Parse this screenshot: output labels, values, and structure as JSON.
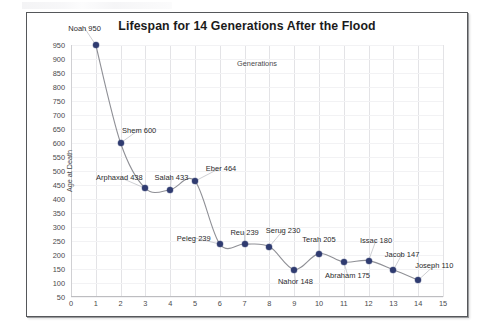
{
  "chart_data": {
    "type": "scatter",
    "title": "Lifespan for 14 Generations After the Flood",
    "xlabel": "Generations",
    "ylabel": "Age at Death",
    "xlim": [
      0,
      15
    ],
    "ylim": [
      50,
      950
    ],
    "grid": true,
    "legend": "none",
    "xticks": [
      "0",
      "1",
      "2",
      "3",
      "4",
      "5",
      "6",
      "7",
      "8",
      "9",
      "10",
      "11",
      "12",
      "13",
      "14",
      "15"
    ],
    "yticks": [
      "950",
      "900",
      "850",
      "800",
      "750",
      "700",
      "650",
      "600",
      "550",
      "500",
      "450",
      "400",
      "350",
      "300",
      "250",
      "200",
      "150",
      "100",
      "50"
    ],
    "categories": [
      1,
      2,
      3,
      4,
      5,
      6,
      7,
      8,
      9,
      10,
      11,
      12,
      13,
      14
    ],
    "values": [
      950,
      600,
      438,
      433,
      464,
      239,
      239,
      230,
      148,
      205,
      175,
      180,
      147,
      110
    ],
    "point_labels": [
      "Noah 950",
      "Shem 600",
      "Arphaxad 438",
      "Salah 433",
      "Eber 464",
      "Peleg 239",
      "Reu 239",
      "Serug 230",
      "Nahor 148",
      "Terah 205",
      "Abraham 175",
      "Issac 180",
      "Jacob 147",
      "Joseph 110"
    ],
    "points": [
      {
        "name": "Noah",
        "x": 1,
        "y": 950,
        "label": "Noah 950",
        "lx": 0.55,
        "ly": 1010
      },
      {
        "name": "Shem",
        "x": 2,
        "y": 600,
        "label": "Shem 600",
        "lx": 2.75,
        "ly": 648
      },
      {
        "name": "Arphaxad",
        "x": 3,
        "y": 438,
        "label": "Arphaxad 438",
        "lx": 1.95,
        "ly": 478
      },
      {
        "name": "Salah",
        "x": 4,
        "y": 433,
        "label": "Salah 433",
        "lx": 4.05,
        "ly": 478
      },
      {
        "name": "Eber",
        "x": 5,
        "y": 464,
        "label": "Eber 464",
        "lx": 6.05,
        "ly": 512
      },
      {
        "name": "Peleg",
        "x": 6,
        "y": 239,
        "label": "Peleg 239",
        "lx": 4.95,
        "ly": 262
      },
      {
        "name": "Reu",
        "x": 7,
        "y": 239,
        "label": "Reu 239",
        "lx": 7.0,
        "ly": 283
      },
      {
        "name": "Serug",
        "x": 8,
        "y": 230,
        "label": "Serug 230",
        "lx": 8.55,
        "ly": 288
      },
      {
        "name": "Nahor",
        "x": 9,
        "y": 148,
        "label": "Nahor 148",
        "lx": 9.05,
        "ly": 108
      },
      {
        "name": "Terah",
        "x": 10,
        "y": 205,
        "label": "Terah 205",
        "lx": 10.0,
        "ly": 256
      },
      {
        "name": "Abraham",
        "x": 11,
        "y": 175,
        "label": "Abraham 175",
        "lx": 11.15,
        "ly": 130
      },
      {
        "name": "Issac",
        "x": 12,
        "y": 180,
        "label": "Issac 180",
        "lx": 12.3,
        "ly": 253
      },
      {
        "name": "Jacob",
        "x": 13,
        "y": 147,
        "label": "Jacob 147",
        "lx": 13.35,
        "ly": 203
      },
      {
        "name": "Joseph",
        "x": 14,
        "y": 110,
        "label": "Joseph 110",
        "lx": 14.65,
        "ly": 163
      }
    ],
    "colors": {
      "marker": "#2f3b70",
      "line": "#8f9096",
      "grid": "#e3e3e6",
      "text": "#4a4a4c",
      "frame": "#55575a"
    }
  }
}
